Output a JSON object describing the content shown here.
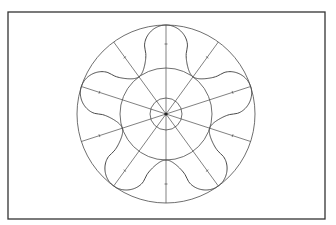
{
  "diagram": {
    "type": "polar-construction",
    "frame": {
      "x": 8,
      "y": 12,
      "width": 317,
      "height": 207,
      "stroke": "#3a3a3a"
    },
    "center": {
      "x": 166,
      "y": 114
    },
    "circles": [
      {
        "name": "outer-circle",
        "r": 89
      },
      {
        "name": "middle-circle",
        "r": 46
      },
      {
        "name": "inner-circle",
        "r": 16
      }
    ],
    "rays": {
      "count": 10,
      "start_angle_deg": -90,
      "length": 89
    },
    "star": {
      "lobes": 5,
      "tip_radius": 89,
      "valley_radius": 46,
      "start_angle_deg": -90
    },
    "colors": {
      "line": "#4a4a4a",
      "background": "#ffffff",
      "frame": "#333333"
    }
  }
}
